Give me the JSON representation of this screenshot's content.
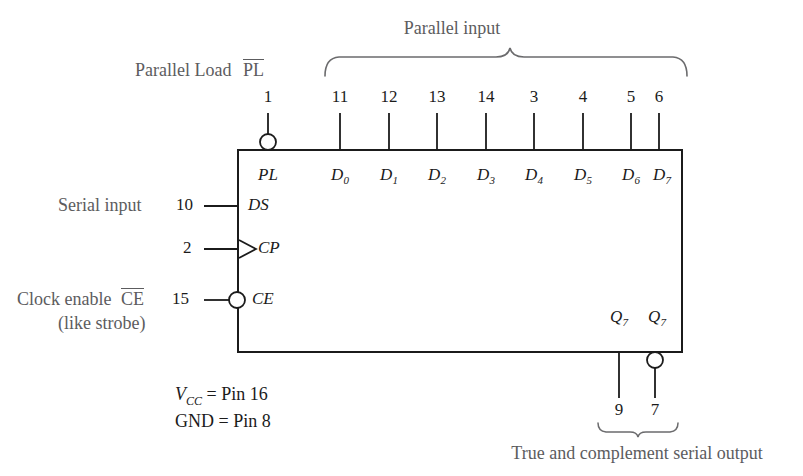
{
  "diagram": {
    "chip_box": {
      "x": 238,
      "y": 150,
      "width": 444,
      "height": 202
    },
    "colors": {
      "line": "#1b1b1b",
      "text_label": "#5c5c5e",
      "text_port": "#1b1b1b",
      "background": "#ffffff"
    }
  },
  "top": {
    "parallel_input_label": "Parallel input",
    "parallel_load_label": "Parallel Load",
    "parallel_load_signal": "PL",
    "parallel_load_pin": "1",
    "pins": [
      {
        "number": "11",
        "x": 340
      },
      {
        "number": "12",
        "x": 389
      },
      {
        "number": "13",
        "x": 437
      },
      {
        "number": "14",
        "x": 486
      },
      {
        "number": "3",
        "x": 534
      },
      {
        "number": "4",
        "x": 583
      },
      {
        "number": "5",
        "x": 631
      },
      {
        "number": "6",
        "x": 659
      }
    ]
  },
  "ports": {
    "inputs_top": [
      {
        "name": "D",
        "index": "0",
        "x": 340
      },
      {
        "name": "D",
        "index": "1",
        "x": 389
      },
      {
        "name": "D",
        "index": "2",
        "x": 437
      },
      {
        "name": "D",
        "index": "3",
        "x": 486
      },
      {
        "name": "D",
        "index": "4",
        "x": 534
      },
      {
        "name": "D",
        "index": "5",
        "x": 583
      },
      {
        "name": "D",
        "index": "6",
        "x": 631
      },
      {
        "name": "D",
        "index": "7",
        "x": 659
      }
    ],
    "left": [
      {
        "label": "PL",
        "pin": "",
        "y": 177,
        "bubble": true,
        "clock": false
      },
      {
        "label": "DS",
        "pin": "10",
        "y": 206,
        "bubble": false,
        "clock": false
      },
      {
        "label": "CP",
        "pin": "2",
        "y": 249,
        "bubble": false,
        "clock": true
      },
      {
        "label": "CE",
        "pin": "15",
        "y": 300,
        "bubble": true,
        "clock": false
      }
    ],
    "outputs": [
      {
        "name": "Q",
        "index": "7",
        "pin": "9",
        "x": 619,
        "bubble": false
      },
      {
        "name": "Q",
        "index": "7",
        "pin": "7",
        "x": 655,
        "bubble": true
      }
    ]
  },
  "left_labels": {
    "serial_input": "Serial input",
    "serial_input_pin": "10",
    "clock_pin": "2",
    "clock_enable": "Clock enable",
    "clock_enable_signal": "CE",
    "clock_enable_pin": "15",
    "clock_enable_note": "(like strobe)"
  },
  "power": {
    "vcc_name": "V",
    "vcc_sub": "CC",
    "vcc_value": "= Pin 16",
    "gnd_line": "GND = Pin 8"
  },
  "bottom": {
    "output_caption": "True and complement serial output"
  }
}
